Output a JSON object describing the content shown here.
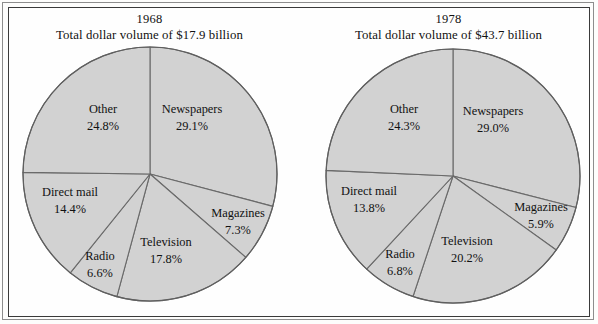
{
  "figure": {
    "background_color": "#fdfdfc",
    "frame_color": "#3a3a3a",
    "slice_fill": "#d2d2d2",
    "slice_stroke": "#6a6a6a"
  },
  "chart_data": [
    {
      "type": "pie",
      "title": "1968",
      "subtitle": "Total dollar volume of $17.9 billion",
      "year": "1968",
      "total_label": "$17.9 billion",
      "start_angle_deg": -90,
      "direction": "clockwise",
      "categories": [
        "Newspapers",
        "Magazines",
        "Television",
        "Radio",
        "Direct mail",
        "Other"
      ],
      "values": [
        29.1,
        7.3,
        17.8,
        6.6,
        14.4,
        24.8
      ],
      "slices": [
        {
          "name": "Newspapers",
          "value": 29.1,
          "percent_label": "29.1%",
          "label_x": 192,
          "label_y": 118
        },
        {
          "name": "Magazines",
          "value": 7.3,
          "percent_label": "7.3%",
          "label_x": 238,
          "label_y": 222
        },
        {
          "name": "Television",
          "value": 17.8,
          "percent_label": "17.8%",
          "label_x": 166,
          "label_y": 251
        },
        {
          "name": "Radio",
          "value": 6.6,
          "percent_label": "6.6%",
          "label_x": 100,
          "label_y": 265
        },
        {
          "name": "Direct mail",
          "value": 14.4,
          "percent_label": "14.4%",
          "label_x": 70,
          "label_y": 201
        },
        {
          "name": "Other",
          "value": 24.8,
          "percent_label": "24.8%",
          "label_x": 103,
          "label_y": 118
        }
      ],
      "center_x": 150,
      "center_y": 174,
      "radius": 127,
      "xlabel": "",
      "ylabel": "",
      "legend": "none",
      "grid": false
    },
    {
      "type": "pie",
      "title": "1978",
      "subtitle": "Total dollar volume of $43.7 billion",
      "year": "1978",
      "total_label": "$43.7 billion",
      "start_angle_deg": -90,
      "direction": "clockwise",
      "categories": [
        "Newspapers",
        "Magazines",
        "Television",
        "Radio",
        "Direct mail",
        "Other"
      ],
      "values": [
        29.0,
        5.9,
        20.2,
        6.8,
        13.8,
        24.3
      ],
      "slices": [
        {
          "name": "Newspapers",
          "value": 29.0,
          "percent_label": "29.0%",
          "label_x": 194,
          "label_y": 120
        },
        {
          "name": "Magazines",
          "value": 5.9,
          "percent_label": "5.9%",
          "label_x": 242,
          "label_y": 216
        },
        {
          "name": "Television",
          "value": 20.2,
          "percent_label": "20.2%",
          "label_x": 168,
          "label_y": 250
        },
        {
          "name": "Radio",
          "value": 6.8,
          "percent_label": "6.8%",
          "label_x": 101,
          "label_y": 263
        },
        {
          "name": "Direct mail",
          "value": 13.8,
          "percent_label": "13.8%",
          "label_x": 70,
          "label_y": 200
        },
        {
          "name": "Other",
          "value": 24.3,
          "percent_label": "24.3%",
          "label_x": 105,
          "label_y": 118
        }
      ],
      "center_x": 154,
      "center_y": 176,
      "radius": 127,
      "xlabel": "",
      "ylabel": "",
      "legend": "none",
      "grid": false
    }
  ]
}
